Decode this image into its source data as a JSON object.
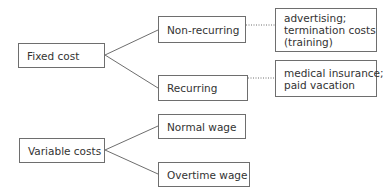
{
  "diagram": {
    "colors": {
      "line": "#6e6e6e",
      "text": "#333333",
      "background": "#ffffff"
    },
    "groups": [
      {
        "root": "Fixed cost",
        "children": [
          {
            "label": "Non-recurring",
            "note": [
              "advertising;",
              "termination costs",
              "(training)"
            ]
          },
          {
            "label": "Recurring",
            "note": [
              "medical insurance;",
              "paid vacation"
            ]
          }
        ]
      },
      {
        "root": "Variable costs",
        "children": [
          {
            "label": "Normal wage"
          },
          {
            "label": "Overtime wage"
          }
        ]
      }
    ]
  }
}
